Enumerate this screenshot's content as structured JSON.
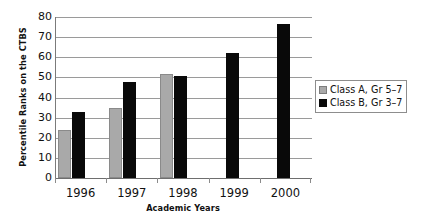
{
  "chart_data": {
    "type": "bar",
    "title": "",
    "xlabel": "Academic Years",
    "ylabel": "Percentile Ranks on the CTBS",
    "categories": [
      "1996",
      "1997",
      "1998",
      "1999",
      "2000"
    ],
    "series": [
      {
        "name": "Class A, Gr 5–7",
        "color": "#a9a9a9",
        "values": [
          24,
          35,
          51.5,
          null,
          null
        ]
      },
      {
        "name": "Class B, Gr 3–7",
        "color": "#090909",
        "values": [
          33,
          47.5,
          50.5,
          62,
          76.5
        ]
      }
    ],
    "ylim": [
      0,
      80
    ],
    "yticks": [
      0,
      10,
      20,
      30,
      40,
      50,
      60,
      70,
      80
    ],
    "ytick_labels": [
      "0",
      "10",
      "20",
      "30",
      "40",
      "50",
      "60",
      "70",
      "80"
    ],
    "grid": true,
    "grid_axis": "y",
    "legend_position": "right"
  }
}
